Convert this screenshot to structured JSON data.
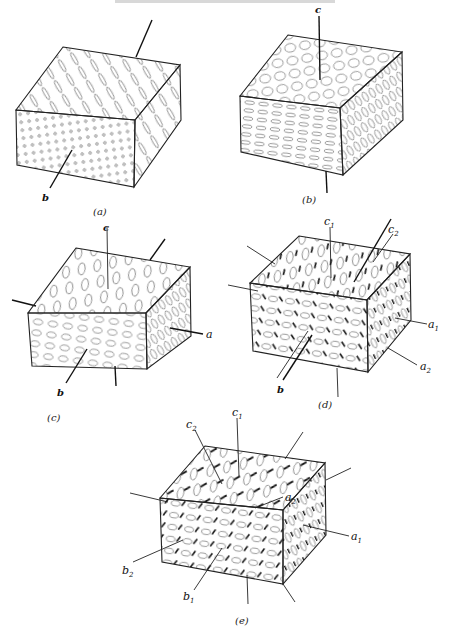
{
  "figure": {
    "panels": [
      {
        "id": "a",
        "caption": "(a)",
        "texture": "elongated needles on top and right faces, small circles on front face",
        "axis_labels": [
          {
            "text": "b",
            "sub": ""
          }
        ],
        "origin": [
          8,
          25
        ]
      },
      {
        "id": "b",
        "caption": "(b)",
        "texture": "circles on top face, flattened ellipses on front face, tall ellipses on right face",
        "axis_labels": [
          {
            "text": "c",
            "sub": ""
          }
        ],
        "origin": [
          232,
          8
        ]
      },
      {
        "id": "c",
        "caption": "(c)",
        "texture": "tilted ellipses on top and right, horizontal ellipses on front",
        "axis_labels": [
          {
            "text": "c",
            "sub": ""
          },
          {
            "text": "a",
            "sub": ""
          },
          {
            "text": "b",
            "sub": ""
          }
        ],
        "origin": [
          12,
          222
        ]
      },
      {
        "id": "d",
        "caption": "(d)",
        "texture": "ellipses plus dark dashes (two orientation sets)",
        "axis_labels": [
          {
            "text": "c",
            "sub": "1"
          },
          {
            "text": "c",
            "sub": "2"
          },
          {
            "text": "a",
            "sub": "1"
          },
          {
            "text": "a",
            "sub": "2"
          },
          {
            "text": "b",
            "sub": ""
          }
        ],
        "origin": [
          232,
          210
        ]
      },
      {
        "id": "e",
        "caption": "(e)",
        "texture": "ellipses plus dark dashes (twinned / two sets)",
        "axis_labels": [
          {
            "text": "c",
            "sub": "1"
          },
          {
            "text": "c",
            "sub": "2"
          },
          {
            "text": "a",
            "sub": "1"
          },
          {
            "text": "a",
            "sub": "2"
          },
          {
            "text": "b",
            "sub": "1"
          },
          {
            "text": "b",
            "sub": "2"
          }
        ],
        "origin": [
          140,
          420
        ]
      }
    ]
  },
  "labels": {
    "a_b": "b",
    "b_c": "c",
    "c_c": "c",
    "c_a": "a",
    "c_b": "b",
    "d_c": "c",
    "d_c1_sub": "1",
    "d_c2_sub": "2",
    "d_a": "a",
    "d_a1_sub": "1",
    "d_a2_sub": "2",
    "d_b": "b",
    "e_c": "c",
    "e_c1_sub": "1",
    "e_c2_sub": "2",
    "e_a": "a",
    "e_a1_sub": "1",
    "e_a2_sub": "2",
    "e_b": "b",
    "e_b1_sub": "1",
    "e_b2_sub": "2"
  },
  "captions": {
    "a": "(a)",
    "b": "(b)",
    "c": "(c)",
    "d": "(d)",
    "e": "(e)"
  },
  "colors": {
    "background": "#ffffff",
    "ink": "#111111",
    "grain_outline": "#555555"
  }
}
